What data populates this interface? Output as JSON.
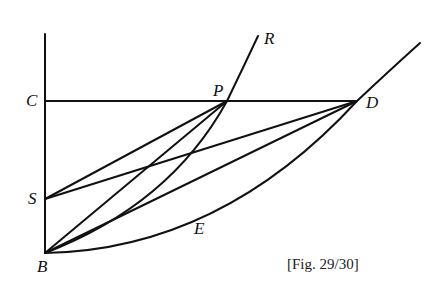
{
  "figure": {
    "caption": "[Fig. 29/30]",
    "points": {
      "C": {
        "label": "C",
        "x": 45,
        "y": 101
      },
      "P": {
        "label": "P",
        "x": 227,
        "y": 101
      },
      "R": {
        "label": "R",
        "x": 258,
        "y": 36
      },
      "D": {
        "label": "D",
        "x": 357,
        "y": 101
      },
      "S": {
        "label": "S",
        "x": 45,
        "y": 199
      },
      "B": {
        "label": "B",
        "x": 45,
        "y": 253
      },
      "E": {
        "label": "E",
        "x": 200,
        "y": 228
      }
    },
    "segments": [
      "C-D",
      "S-P",
      "S-D",
      "B-P",
      "B-D",
      "B-vertical-axis"
    ],
    "curves": [
      "B-P-R",
      "B-E-D-extension"
    ],
    "stroke_color": "#111111",
    "background": "#ffffff"
  }
}
